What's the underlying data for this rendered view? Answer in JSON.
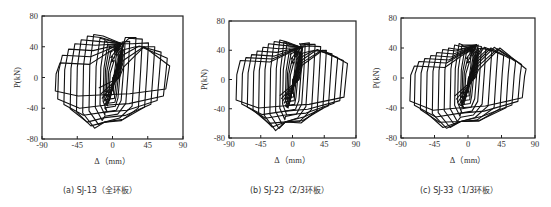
{
  "chart_data": [
    {
      "type": "line",
      "title": "(a) SJ-13（全环板）",
      "caption_letter": "(a)",
      "specimen": "SJ-13",
      "variant": "（全环板）",
      "xlabel": "Δ（mm）",
      "ylabel": "P(kN)",
      "xlim": [
        -90,
        90
      ],
      "ylim": [
        -80,
        80
      ],
      "xticks": [
        -90,
        -45,
        0,
        45,
        90
      ],
      "yticks": [
        -80,
        -40,
        0,
        40,
        80
      ],
      "grid": false,
      "legend": null,
      "frame": {
        "x": 42,
        "y": 16,
        "w": 141,
        "h": 123
      },
      "caption_pos": {
        "x": 63,
        "y": 178
      },
      "loops": {
        "pos_amplitudes": [
          4,
          6,
          8,
          10,
          12,
          16,
          22,
          30,
          38,
          46,
          54,
          62,
          70,
          73
        ],
        "neg_amplitudes": [
          -4,
          -6,
          -8,
          -10,
          -12,
          -16,
          -22,
          -30,
          -38,
          -46,
          -54,
          -62,
          -70,
          -73
        ],
        "peak_pos_load": [
          18,
          24,
          30,
          36,
          40,
          44,
          47,
          52,
          50,
          45,
          40,
          33,
          25,
          15
        ],
        "peak_neg_load": [
          -20,
          -26,
          -32,
          -38,
          -44,
          -50,
          -56,
          -62,
          -66,
          -64,
          -58,
          -50,
          -40,
          -25
        ]
      }
    },
    {
      "type": "line",
      "title": "(b) SJ-23（2/3环板）",
      "caption_letter": "(b)",
      "specimen": "SJ-23",
      "variant": "（2/3环板）",
      "xlabel": "Δ（mm）",
      "ylabel": "P(kN)",
      "xlim": [
        -90,
        90
      ],
      "ylim": [
        -80,
        80
      ],
      "xticks": [
        -90,
        -45,
        0,
        45,
        90
      ],
      "yticks": [
        -80,
        -40,
        0,
        40,
        80
      ],
      "grid": false,
      "legend": null,
      "frame": {
        "x": 229,
        "y": 21,
        "w": 127,
        "h": 117
      },
      "caption_pos": {
        "x": 250,
        "y": 178
      },
      "loops": {
        "pos_amplitudes": [
          4,
          6,
          8,
          10,
          14,
          18,
          24,
          32,
          40,
          48,
          56,
          64,
          72,
          78
        ],
        "neg_amplitudes": [
          -4,
          -6,
          -8,
          -10,
          -14,
          -18,
          -24,
          -32,
          -40,
          -48,
          -56,
          -64,
          -72,
          -80
        ],
        "peak_pos_load": [
          20,
          26,
          32,
          38,
          44,
          48,
          50,
          48,
          45,
          40,
          35,
          30,
          26,
          22
        ],
        "peak_neg_load": [
          -22,
          -28,
          -34,
          -40,
          -48,
          -56,
          -62,
          -68,
          -70,
          -66,
          -60,
          -54,
          -48,
          -40
        ]
      }
    },
    {
      "type": "line",
      "title": "(c) SJ-33（1/3环板）",
      "caption_letter": "(c)",
      "specimen": "SJ-33",
      "variant": "（1/3环板）",
      "xlabel": "Δ（mm）",
      "ylabel": "P(kN)",
      "xlim": [
        -90,
        90
      ],
      "ylim": [
        -80,
        80
      ],
      "xticks": [
        -90,
        -45,
        0,
        45,
        90
      ],
      "yticks": [
        -80,
        -40,
        0,
        40,
        80
      ],
      "grid": false,
      "legend": null,
      "frame": {
        "x": 401,
        "y": 18,
        "w": 134,
        "h": 120
      },
      "caption_pos": {
        "x": 420,
        "y": 178
      },
      "loops": {
        "pos_amplitudes": [
          4,
          6,
          8,
          10,
          14,
          18,
          24,
          32,
          40,
          48,
          56,
          64,
          72,
          78
        ],
        "neg_amplitudes": [
          -4,
          -6,
          -8,
          -10,
          -14,
          -18,
          -24,
          -32,
          -40,
          -48,
          -56,
          -64,
          -72,
          -78
        ],
        "peak_pos_load": [
          18,
          24,
          30,
          36,
          40,
          42,
          40,
          36,
          34,
          30,
          26,
          22,
          18,
          12
        ],
        "peak_neg_load": [
          -22,
          -28,
          -34,
          -40,
          -46,
          -52,
          -58,
          -62,
          -66,
          -68,
          -66,
          -60,
          -52,
          -44
        ]
      }
    }
  ]
}
